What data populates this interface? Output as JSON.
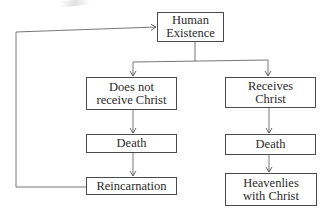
{
  "diagram": {
    "type": "flowchart",
    "nodes": {
      "human_existence": {
        "line1": "Human",
        "line2": "Existence"
      },
      "does_not_receive": {
        "line1": "Does not",
        "line2": "receive Christ"
      },
      "receives": {
        "line1": "Receives",
        "line2": "Christ"
      },
      "death_left": {
        "label": "Death"
      },
      "death_right": {
        "label": "Death"
      },
      "reincarnation": {
        "label": "Reincarnation"
      },
      "heavenlies": {
        "line1": "Heavenlies",
        "line2": "with Christ"
      }
    },
    "edges": [
      {
        "from": "Human Existence",
        "to": "Does not receive Christ"
      },
      {
        "from": "Human Existence",
        "to": "Receives Christ"
      },
      {
        "from": "Does not receive Christ",
        "to": "Death"
      },
      {
        "from": "Death",
        "to": "Reincarnation"
      },
      {
        "from": "Reincarnation",
        "to": "Human Existence"
      },
      {
        "from": "Receives Christ",
        "to": "Death"
      },
      {
        "from": "Death",
        "to": "Heavenlies with Christ"
      }
    ],
    "line_color": "#555555"
  }
}
